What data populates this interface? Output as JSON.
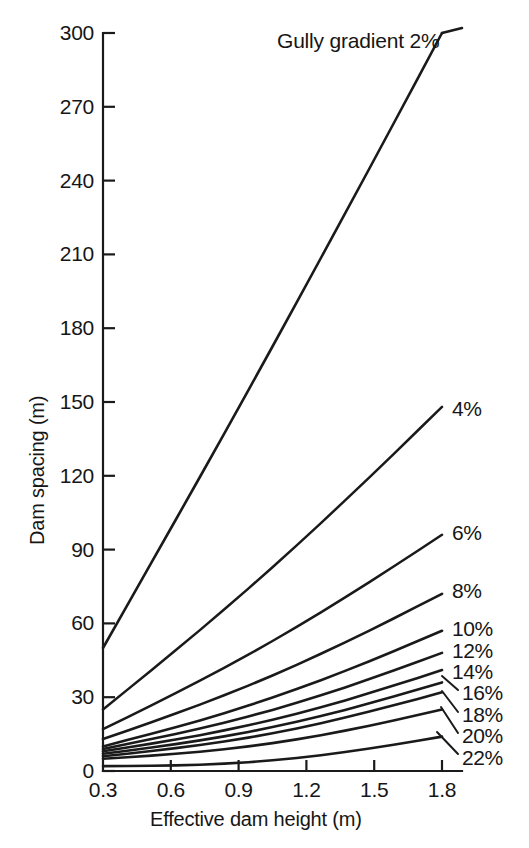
{
  "figure": {
    "kind": "scanned-line-chart",
    "ink_color": "#1a1a1a",
    "background_color": "#ffffff"
  },
  "axes": {
    "y": {
      "title": "Dam spacing (m)",
      "ticks": [
        "0",
        "30",
        "60",
        "90",
        "120",
        "150",
        "180",
        "210",
        "240",
        "270",
        "300"
      ],
      "min": 0,
      "max": 300
    },
    "x": {
      "title": "Effective dam height (m)",
      "ticks": [
        "0.3",
        "0.6",
        "0.9",
        "1.2",
        "1.5",
        "1.8"
      ],
      "min": 0.3,
      "max": 1.8
    }
  },
  "annotation": {
    "main_label": "Gully gradient 2%"
  },
  "caption": {
    "cut_off_fragment": ""
  },
  "chart_data": {
    "type": "line",
    "title": "",
    "subtitle": "",
    "xlabel": "Effective dam height (m)",
    "ylabel": "Dam spacing (m)",
    "xlim": [
      0.3,
      1.8
    ],
    "ylim": [
      0,
      300
    ],
    "xticks": [
      0.3,
      0.6,
      0.9,
      1.2,
      1.5,
      1.8
    ],
    "yticks": [
      0,
      30,
      60,
      90,
      120,
      150,
      180,
      210,
      240,
      270,
      300
    ],
    "grid": false,
    "legend": "inline-end-of-line labels",
    "annotations": [
      "Gully gradient 2%"
    ],
    "x": [
      0.3,
      1.8
    ],
    "series": [
      {
        "name": "2%",
        "label": "Gully gradient 2%",
        "gradient_percent": 2,
        "values": [
          50,
          300
        ]
      },
      {
        "name": "4%",
        "label": "4%",
        "gradient_percent": 4,
        "values": [
          25,
          148
        ]
      },
      {
        "name": "6%",
        "label": "6%",
        "gradient_percent": 6,
        "values": [
          17,
          96
        ]
      },
      {
        "name": "8%",
        "label": "8%",
        "gradient_percent": 8,
        "values": [
          13,
          72
        ]
      },
      {
        "name": "10%",
        "label": "10%",
        "gradient_percent": 10,
        "values": [
          10,
          57
        ]
      },
      {
        "name": "12%",
        "label": "12%",
        "gradient_percent": 12,
        "values": [
          9,
          48
        ]
      },
      {
        "name": "14%",
        "label": "14%",
        "gradient_percent": 14,
        "values": [
          8,
          41
        ]
      },
      {
        "name": "16%",
        "label": "16%",
        "gradient_percent": 16,
        "values": [
          7,
          36
        ]
      },
      {
        "name": "18%",
        "label": "18%",
        "gradient_percent": 18,
        "values": [
          6,
          32
        ]
      },
      {
        "name": "20%",
        "label": "20%",
        "gradient_percent": 20,
        "values": [
          5,
          25
        ]
      },
      {
        "name": "22%",
        "label": "22%",
        "gradient_percent": 22,
        "values": [
          2,
          14
        ]
      }
    ]
  }
}
